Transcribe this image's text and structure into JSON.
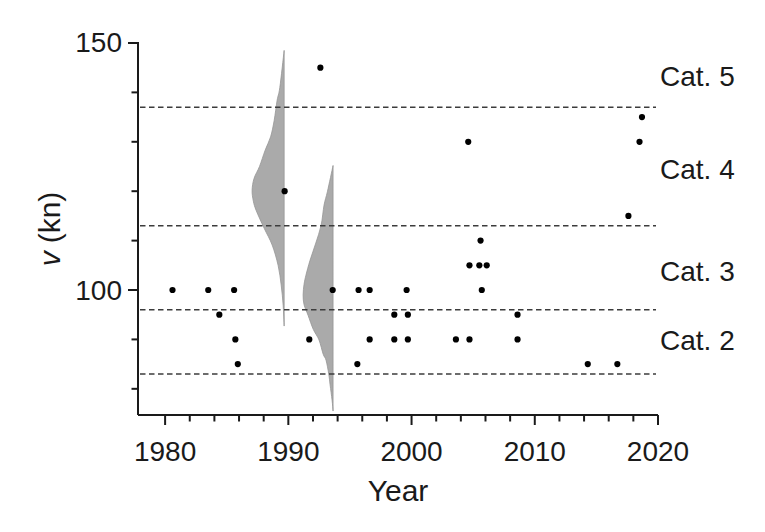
{
  "figure": {
    "colors": {
      "ink": "#1a1a1a",
      "point": "#000000",
      "violin_fill": "#aaaaaa",
      "violin_edge": "#969696",
      "dashed_line": "#3c3c3c",
      "background": "#ffffff"
    }
  },
  "chart_data": {
    "type": "scatter",
    "title": "",
    "xlabel": "Year",
    "ylabel_variable": "v",
    "ylabel_unit": "(kn)",
    "x_range": [
      1977.8,
      2020
    ],
    "y_range": [
      74.7,
      150.2
    ],
    "x_major_ticks": [
      1980,
      1990,
      2000,
      2010,
      2020
    ],
    "x_minor_ticks": [
      1982,
      1984,
      1986,
      1988,
      1992,
      1994,
      1996,
      1998,
      2002,
      2004,
      2006,
      2008,
      2012,
      2014,
      2016,
      2018
    ],
    "y_major_ticks": [
      100,
      150
    ],
    "y_minor_ticks": [
      80,
      90,
      110,
      120,
      130,
      140
    ],
    "grid": "off",
    "legend": "none",
    "category_boundaries_kn": [
      137,
      113,
      96,
      83
    ],
    "category_labels": [
      {
        "label": "Cat. 5",
        "v": 143.2
      },
      {
        "label": "Cat. 4",
        "v": 124.4
      },
      {
        "label": "Cat. 3",
        "v": 103.8
      },
      {
        "label": "Cat. 2",
        "v": 89.7
      }
    ],
    "points": [
      {
        "year": 1980.6,
        "v": 100
      },
      {
        "year": 1983.5,
        "v": 100
      },
      {
        "year": 1984.4,
        "v": 95
      },
      {
        "year": 1985.6,
        "v": 100
      },
      {
        "year": 1985.7,
        "v": 90
      },
      {
        "year": 1985.9,
        "v": 85
      },
      {
        "year": 1989.7,
        "v": 120
      },
      {
        "year": 1991.7,
        "v": 90
      },
      {
        "year": 1992.6,
        "v": 145
      },
      {
        "year": 1993.6,
        "v": 100
      },
      {
        "year": 1995.6,
        "v": 85
      },
      {
        "year": 1995.7,
        "v": 100
      },
      {
        "year": 1996.6,
        "v": 100
      },
      {
        "year": 1996.6,
        "v": 90
      },
      {
        "year": 1998.6,
        "v": 95
      },
      {
        "year": 1998.6,
        "v": 90
      },
      {
        "year": 1999.6,
        "v": 100
      },
      {
        "year": 1999.7,
        "v": 95
      },
      {
        "year": 1999.7,
        "v": 90
      },
      {
        "year": 2003.6,
        "v": 90
      },
      {
        "year": 2004.6,
        "v": 130
      },
      {
        "year": 2004.7,
        "v": 105
      },
      {
        "year": 2004.7,
        "v": 90
      },
      {
        "year": 2005.5,
        "v": 105
      },
      {
        "year": 2005.6,
        "v": 110
      },
      {
        "year": 2005.7,
        "v": 100
      },
      {
        "year": 2006.1,
        "v": 105
      },
      {
        "year": 2008.6,
        "v": 95
      },
      {
        "year": 2008.6,
        "v": 90
      },
      {
        "year": 2014.3,
        "v": 85
      },
      {
        "year": 2016.7,
        "v": 85
      },
      {
        "year": 2017.6,
        "v": 115
      },
      {
        "year": 2018.5,
        "v": 130
      },
      {
        "year": 2018.7,
        "v": 135
      }
    ],
    "violins": [
      {
        "name": "violin-1989",
        "edge_year": 1989.66,
        "side": "left",
        "profile_v_width_years": [
          [
            148.5,
            0
          ],
          [
            141.0,
            0.35
          ],
          [
            138.4,
            0.57
          ],
          [
            134.3,
            0.81
          ],
          [
            131.0,
            1.1
          ],
          [
            128.3,
            1.54
          ],
          [
            125.0,
            2.0
          ],
          [
            122.6,
            2.44
          ],
          [
            120.2,
            2.6
          ],
          [
            118.0,
            2.5
          ],
          [
            116.1,
            2.27
          ],
          [
            112.5,
            1.62
          ],
          [
            109.1,
            0.97
          ],
          [
            105.0,
            0.49
          ],
          [
            101.0,
            0.24
          ],
          [
            96.9,
            0.08
          ],
          [
            92.7,
            0
          ]
        ]
      },
      {
        "name": "violin-1993",
        "edge_year": 1993.63,
        "side": "left",
        "profile_v_width_years": [
          [
            125.2,
            0
          ],
          [
            120.0,
            0.45
          ],
          [
            117.2,
            0.73
          ],
          [
            113.1,
            0.97
          ],
          [
            109.5,
            1.4
          ],
          [
            106.0,
            1.87
          ],
          [
            103.0,
            2.2
          ],
          [
            101.2,
            2.35
          ],
          [
            99.0,
            2.43
          ],
          [
            97.0,
            2.35
          ],
          [
            94.9,
            2.03
          ],
          [
            92.0,
            1.6
          ],
          [
            89.9,
            1.14
          ],
          [
            87.0,
            0.8
          ],
          [
            85.8,
            0.57
          ],
          [
            83.0,
            0.35
          ],
          [
            80.8,
            0.24
          ],
          [
            77.7,
            0.08
          ],
          [
            75.5,
            0
          ]
        ]
      }
    ]
  }
}
